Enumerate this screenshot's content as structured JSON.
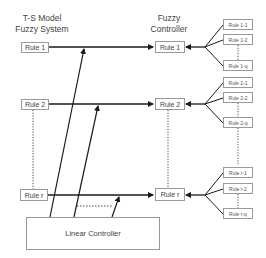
{
  "titles": {
    "left": [
      "T-S Model",
      "Fuzzy System"
    ],
    "center": [
      "Fuzzy",
      "Controller"
    ]
  },
  "left_rules": [
    "Rule 1",
    "Rule 2",
    "Rule r"
  ],
  "center_rules": [
    "Rule 1",
    "Rule 2",
    "Rule r"
  ],
  "sub_rules": {
    "group1": [
      "Rule 1-1",
      "Rule 1-2",
      "Rule 1-q"
    ],
    "group2": [
      "Rule 2-1",
      "Rule 2-2",
      "Rule 2-q"
    ],
    "groupr": [
      "Rule r-1",
      "Rule r-2",
      "Rule r-q"
    ]
  },
  "linear_controller": "Linear Controller",
  "colors": {
    "line": "#1a1a1a",
    "box_border": "#9a9a9a"
  }
}
